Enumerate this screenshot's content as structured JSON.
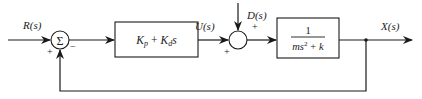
{
  "diagram": {
    "type": "feedback-control-block-diagram",
    "signals": {
      "input": "R(s)",
      "control": "U(s)",
      "disturbance": "D(s)",
      "output": "X(s)"
    },
    "summing_junctions": [
      {
        "id": "sum1",
        "symbol": "Σ",
        "signs": {
          "reference": "+",
          "feedback": "−"
        }
      },
      {
        "id": "sum2",
        "symbol": "",
        "signs": {
          "control": "+",
          "disturbance": "+"
        }
      }
    ],
    "blocks": [
      {
        "id": "controller",
        "label": "K_p + K_d s",
        "kp_main": "K",
        "kp_sub": "p",
        "plus": "+",
        "kd_main": "K",
        "kd_sub": "d",
        "kd_var": "s"
      },
      {
        "id": "plant",
        "numerator": "1",
        "denominator_m": "ms",
        "denominator_exp": "2",
        "denominator_rest": "+ k"
      }
    ],
    "feedback": "unity negative feedback from X(s) to Σ"
  }
}
